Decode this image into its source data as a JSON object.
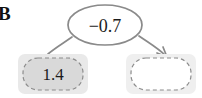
{
  "figure": {
    "panel_tag": "B",
    "width": 202,
    "height": 98,
    "background_color": "#ffffff"
  },
  "colors": {
    "node_fill_filled": "#d9d9d9",
    "node_fill_empty": "#ffffff",
    "node_container": "#e8e8e8",
    "node_dash_stroke": "#8c8c8c",
    "edge_stroke": "#8a8a8a",
    "ellipse_stroke": "#8a8a8a",
    "ellipse_fill": "#ffffff",
    "text_color": "#1c1c1c"
  },
  "diagram": {
    "type": "causal-edge-diagram",
    "nodes": [
      {
        "id": "source-node",
        "name": "node-source",
        "label": "1.4",
        "filled": true,
        "shape": "rounded-rect-dashed",
        "x": 18,
        "y": 54,
        "width": 70,
        "height": 40
      },
      {
        "id": "target-node",
        "name": "node-target",
        "label": "",
        "filled": false,
        "shape": "rounded-rect-dashed",
        "x": 126,
        "y": 54,
        "width": 70,
        "height": 40
      }
    ],
    "edges": [
      {
        "id": "weight-edge",
        "name": "edge-weight",
        "label": "-0.7",
        "from": "source-node",
        "to": "target-node",
        "arrowhead": true,
        "ellipse": {
          "cx": 105,
          "cy": 25,
          "rx": 37,
          "ry": 20
        }
      }
    ]
  }
}
